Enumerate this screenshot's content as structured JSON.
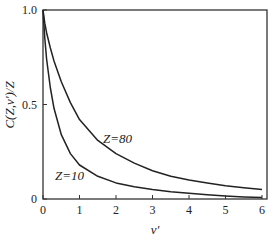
{
  "chart_data": {
    "type": "line",
    "title": "",
    "xlabel": "v'",
    "ylabel": "C(Z,v')/Z",
    "xlim": [
      0,
      6
    ],
    "ylim": [
      0,
      1.0
    ],
    "x_ticks": [
      "0",
      "1",
      "2",
      "3",
      "4",
      "5",
      "6"
    ],
    "y_ticks": [
      "0",
      "0.5",
      "1.0"
    ],
    "grid": false,
    "legend": "inline annotations",
    "series": [
      {
        "name": "Z=80",
        "annotation": "Z=80",
        "x": [
          0,
          0.05,
          0.1,
          0.2,
          0.3,
          0.5,
          0.75,
          1.0,
          1.5,
          2.0,
          2.5,
          3.0,
          3.5,
          4.0,
          4.5,
          5.0,
          5.5,
          6.0
        ],
        "values": [
          1.0,
          0.93,
          0.88,
          0.8,
          0.73,
          0.62,
          0.51,
          0.42,
          0.31,
          0.24,
          0.19,
          0.15,
          0.12,
          0.1,
          0.085,
          0.07,
          0.06,
          0.05
        ]
      },
      {
        "name": "Z=10",
        "annotation": "Z=10",
        "x": [
          0,
          0.05,
          0.1,
          0.2,
          0.3,
          0.5,
          0.75,
          1.0,
          1.5,
          2.0,
          2.5,
          3.0,
          3.5,
          4.0,
          4.5,
          5.0,
          5.5,
          6.0
        ],
        "values": [
          1.0,
          0.85,
          0.74,
          0.59,
          0.48,
          0.34,
          0.24,
          0.18,
          0.12,
          0.085,
          0.065,
          0.05,
          0.038,
          0.03,
          0.022,
          0.016,
          0.011,
          0.008
        ]
      }
    ]
  },
  "labels": {
    "xlabel": "v'",
    "ylabel": "C(Z,v')/Z",
    "z80": "Z=80",
    "z10": "Z=10"
  }
}
